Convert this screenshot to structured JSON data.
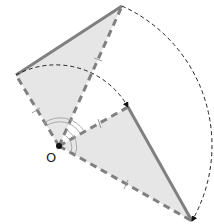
{
  "diagram": {
    "type": "rotation",
    "center_label": "O",
    "colors": {
      "fill": "#e6e6e6",
      "edge": "#808080",
      "arc": "#222222",
      "point": "#111111"
    },
    "points": {
      "O": [
        59,
        146
      ],
      "A": [
        16,
        75
      ],
      "B": [
        122,
        6
      ],
      "A_prime": [
        128,
        107
      ],
      "B_prime": [
        192,
        221
      ]
    },
    "triangles": [
      {
        "name": "original",
        "vertices": [
          "O",
          "A",
          "B"
        ]
      },
      {
        "name": "rotated",
        "vertices": [
          "O",
          "A_prime",
          "B_prime"
        ]
      }
    ],
    "rotation_arcs": [
      {
        "from": "A",
        "to": "A_prime"
      },
      {
        "from": "B",
        "to": "B_prime"
      }
    ]
  }
}
